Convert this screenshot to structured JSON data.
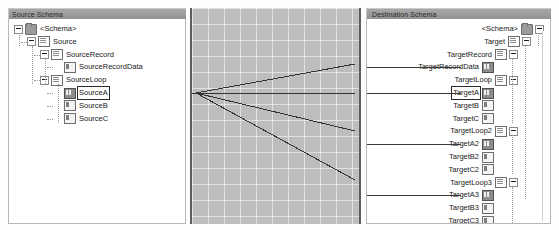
{
  "source_panel": {
    "title": "Source Schema",
    "nodes": [
      {
        "label": "<Schema>",
        "icon": "folder-icon",
        "expander": "minus",
        "indent": 0
      },
      {
        "label": "Source",
        "icon": "document-icon",
        "expander": "minus",
        "indent": 1
      },
      {
        "label": "SourceRecord",
        "icon": "document-icon",
        "expander": "minus",
        "indent": 2
      },
      {
        "label": "SourceRecordData",
        "icon": "attribute-icon",
        "expander": "none",
        "indent": 3
      },
      {
        "label": "SourceLoop",
        "icon": "document-icon",
        "expander": "minus",
        "indent": 2
      },
      {
        "label": "SourceA",
        "icon": "loop-item-icon",
        "expander": "none",
        "indent": 3,
        "selected": true
      },
      {
        "label": "SourceB",
        "icon": "attribute-icon",
        "expander": "none",
        "indent": 3
      },
      {
        "label": "SourceC",
        "icon": "attribute-icon",
        "expander": "none",
        "indent": 3
      }
    ]
  },
  "grid_panel": {
    "name": "mapping-grid",
    "background_color": "#bdbdbd",
    "grid_line_color": "#ffffff",
    "grid_spacing_px": 16,
    "link_color": "#333333",
    "junction": {
      "x": 4,
      "y": 85
    },
    "links": [
      {
        "from": "SourceA",
        "to": "TargetRecordData",
        "end_y": 56
      },
      {
        "from": "SourceA",
        "to": "TargetA",
        "end_y": 85
      },
      {
        "from": "SourceA",
        "to": "TargetA2",
        "end_y": 123
      },
      {
        "from": "SourceA",
        "to": "TargetA3",
        "end_y": 172
      }
    ]
  },
  "destination_panel": {
    "title": "Destination Schema",
    "nodes": [
      {
        "label": "<Schema>",
        "icon": "folder-icon",
        "expander": "minus",
        "indent": 0
      },
      {
        "label": "Target",
        "icon": "document-icon",
        "expander": "minus",
        "indent": 1
      },
      {
        "label": "TargetRecord",
        "icon": "document-icon",
        "expander": "minus",
        "indent": 2
      },
      {
        "label": "TargetRecordData",
        "icon": "loop-item-icon",
        "expander": "none",
        "indent": 3,
        "linked": true
      },
      {
        "label": "TargetLoop",
        "icon": "document-icon",
        "expander": "minus",
        "indent": 2
      },
      {
        "label": "TargetA",
        "icon": "loop-item-icon",
        "expander": "none",
        "indent": 3,
        "selected": true,
        "linked": true
      },
      {
        "label": "TargetB",
        "icon": "attribute-icon",
        "expander": "none",
        "indent": 3
      },
      {
        "label": "TargetC",
        "icon": "attribute-icon",
        "expander": "none",
        "indent": 3
      },
      {
        "label": "TargetLoop2",
        "icon": "document-icon",
        "expander": "minus",
        "indent": 2
      },
      {
        "label": "TargetA2",
        "icon": "loop-item-icon",
        "expander": "none",
        "indent": 3,
        "linked": true
      },
      {
        "label": "TargetB2",
        "icon": "attribute-icon",
        "expander": "none",
        "indent": 3
      },
      {
        "label": "TargetC2",
        "icon": "attribute-icon",
        "expander": "none",
        "indent": 3
      },
      {
        "label": "TargetLoop3",
        "icon": "document-icon",
        "expander": "minus",
        "indent": 2
      },
      {
        "label": "TargetA3",
        "icon": "loop-item-icon",
        "expander": "none",
        "indent": 3,
        "linked": true
      },
      {
        "label": "TargetB3",
        "icon": "attribute-icon",
        "expander": "none",
        "indent": 3
      },
      {
        "label": "TargetC3",
        "icon": "attribute-icon",
        "expander": "none",
        "indent": 3
      }
    ]
  }
}
